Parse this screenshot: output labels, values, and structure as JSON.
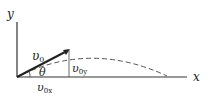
{
  "diagram": {
    "type": "projectile-velocity-decomposition",
    "axes": {
      "y_label": "y",
      "x_label": "x"
    },
    "labels": {
      "v0": "υ",
      "v0_sub": "0",
      "theta": "θ",
      "v0y": "υ",
      "v0y_sub": "0y",
      "v0x": "υ",
      "v0x_sub": "0x"
    },
    "colors": {
      "line": "#333333",
      "dashed": "#555555"
    }
  }
}
